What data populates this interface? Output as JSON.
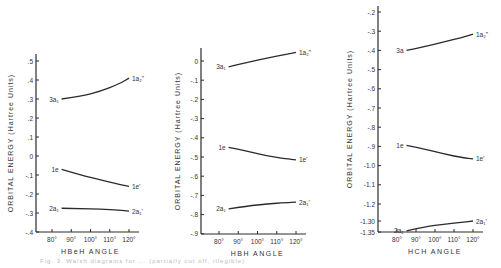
{
  "figure": {
    "caption_fragment": "Fig. 3. Walsh diagrams for ... (partially cut off, illegible)"
  },
  "chart_data": [
    {
      "type": "line",
      "title": "",
      "xlabel": "HBeH  ANGLE",
      "ylabel": "ORBITAL  ENERGY (Hartree Units)",
      "x_ticks": [
        "80°",
        "90°",
        "100°",
        "110°",
        "120°"
      ],
      "x_tick_values": [
        80,
        90,
        100,
        110,
        120
      ],
      "y_ticks": [
        ".5",
        ".4",
        ".3",
        ".2",
        ".1",
        "0",
        "-.1",
        "-.2",
        "-.3",
        "-.4"
      ],
      "y_tick_values": [
        0.5,
        0.4,
        0.3,
        0.2,
        0.1,
        0,
        -0.1,
        -0.2,
        -0.3,
        -0.4
      ],
      "ylim": [
        -0.4,
        0.5
      ],
      "xlim": [
        74,
        124
      ],
      "grid": false,
      "series": [
        {
          "name": "3a1 → 1a2\"",
          "left_label": "3a₁",
          "right_label": "1a₂\"",
          "x": [
            85,
            95,
            105,
            115,
            120
          ],
          "values": [
            0.3,
            0.315,
            0.34,
            0.38,
            0.41
          ]
        },
        {
          "name": "1e → 1e'",
          "left_label": "1e",
          "right_label": "1e'",
          "x": [
            85,
            95,
            105,
            115,
            120
          ],
          "values": [
            -0.07,
            -0.1,
            -0.125,
            -0.15,
            -0.16
          ]
        },
        {
          "name": "2a1 → 2a1'",
          "left_label": "2a₁",
          "right_label": "2a₁'",
          "x": [
            85,
            95,
            105,
            115,
            120
          ],
          "values": [
            -0.275,
            -0.277,
            -0.28,
            -0.285,
            -0.29
          ]
        }
      ]
    },
    {
      "type": "line",
      "title": "",
      "xlabel": "HBH  ANGLE",
      "ylabel": "ORBITAL  ENERGY (Hartree Units)",
      "x_ticks": [
        "80°",
        "90°",
        "100°",
        "110°",
        "120°"
      ],
      "x_tick_values": [
        80,
        90,
        100,
        110,
        120
      ],
      "y_ticks": [
        "0",
        "-.1",
        "-.2",
        "-.3",
        "-.4",
        "-.5",
        "-.6",
        "-.7",
        "-.8",
        "-.9"
      ],
      "y_tick_values": [
        0,
        -0.1,
        -0.2,
        -0.3,
        -0.4,
        -0.5,
        -0.6,
        -0.7,
        -0.8,
        -0.9
      ],
      "ylim": [
        -0.9,
        0.06
      ],
      "xlim": [
        74,
        124
      ],
      "grid": false,
      "series": [
        {
          "name": "3a1 → 1a2\"",
          "left_label": "3a₁",
          "right_label": "1a₂\"",
          "x": [
            85,
            95,
            105,
            115,
            120
          ],
          "values": [
            -0.03,
            -0.005,
            0.015,
            0.035,
            0.045
          ]
        },
        {
          "name": "1e → 1e'",
          "left_label": "1e",
          "right_label": "1e'",
          "x": [
            85,
            95,
            105,
            115,
            120
          ],
          "values": [
            -0.45,
            -0.47,
            -0.495,
            -0.51,
            -0.515
          ]
        },
        {
          "name": "2a1 → 2a1'",
          "left_label": "2a₁",
          "right_label": "2a₁'",
          "x": [
            85,
            95,
            105,
            115,
            120
          ],
          "values": [
            -0.77,
            -0.755,
            -0.745,
            -0.737,
            -0.735
          ]
        }
      ]
    },
    {
      "type": "line",
      "title": "",
      "xlabel": "HCH  ANGLE",
      "ylabel": "ORBITAL  ENERGY (Hartree Units)",
      "x_ticks": [
        "80°",
        "90°",
        "100°",
        "110°",
        "120°"
      ],
      "x_tick_values": [
        80,
        90,
        100,
        110,
        120
      ],
      "y_ticks": [
        "-.2",
        "-.3",
        "-.4",
        "-.5",
        "-.6",
        "-.7",
        "-.8",
        "-.9",
        "-1.0",
        "-1.1",
        "-1.2",
        "-1.30",
        "-1.35"
      ],
      "y_tick_values": [
        -0.2,
        -0.3,
        -0.4,
        -0.5,
        -0.6,
        -0.7,
        -0.8,
        -0.9,
        -1.0,
        -1.1,
        -1.2,
        -1.3,
        -1.35
      ],
      "ylim": [
        -1.35,
        -0.2
      ],
      "xlim": [
        74,
        124
      ],
      "grid": false,
      "series": [
        {
          "name": "3a → 1a2\"",
          "left_label": "3a",
          "right_label": "1a₂\"",
          "x": [
            85,
            95,
            105,
            115,
            120
          ],
          "values": [
            -0.4,
            -0.38,
            -0.355,
            -0.33,
            -0.315
          ]
        },
        {
          "name": "1e → 1e'",
          "left_label": "1e",
          "right_label": "1e'",
          "x": [
            85,
            95,
            105,
            115,
            120
          ],
          "values": [
            -0.895,
            -0.915,
            -0.94,
            -0.96,
            -0.965
          ]
        },
        {
          "name": "2a1 → 2a1'",
          "left_label": "2a₁",
          "right_label": "2a₁'",
          "x": [
            85,
            95,
            105,
            115,
            120
          ],
          "values": [
            -1.345,
            -1.325,
            -1.315,
            -1.305,
            -1.3
          ]
        }
      ]
    }
  ],
  "panels_layout": [
    {
      "axis_x": 36,
      "x_axis_y": 232,
      "x80": 52,
      "x120": 129,
      "y_top_tick_px": 61,
      "y_step_px": 19.0,
      "label_x": 13
    },
    {
      "axis_x": 201,
      "x_axis_y": 234,
      "x80": 219,
      "x120": 296,
      "y_top_tick_px": 61,
      "y_step_px": 19.2,
      "label_x": 180
    },
    {
      "axis_x": 378,
      "x_axis_y": 232,
      "x80": 397,
      "x120": 473,
      "y_top_tick_px": 12,
      "y_step_px": 19.2,
      "label_x": 352
    }
  ]
}
